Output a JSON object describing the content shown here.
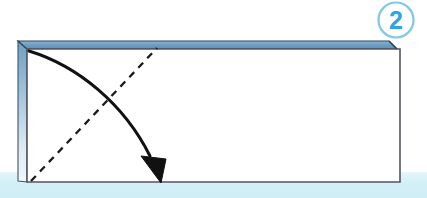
{
  "illustration": {
    "title": "Paper folding step diagram",
    "step_badge": {
      "label": "2",
      "shape": "circle-outline",
      "circle_color": "#7ec8ea",
      "text_color": "#2ba6e0",
      "center_x": 396,
      "center_y": 20,
      "radius": 18
    },
    "surface_band": {
      "name": "table-surface",
      "color": "#d6f0f7",
      "top_y": 172,
      "height": 26
    },
    "paper": {
      "front_sheet": {
        "name": "paper-front-sheet",
        "fill": "#ffffff",
        "stroke": "#4a4a52",
        "left": 27,
        "top": 49,
        "right": 400,
        "bottom": 182
      },
      "back_sheet_top_edge": {
        "name": "paper-back-top-edge",
        "fill": "#6f9fc4",
        "stroke": "#2f4558",
        "left": 18,
        "top": 41,
        "right": 397,
        "bottom": 49
      },
      "back_sheet_left_edge": {
        "name": "paper-back-left-edge",
        "fill_top": "#6f9fc4",
        "fill_bottom": "#eef4f8",
        "stroke": "#2f4558",
        "x": 18,
        "top": 41,
        "bottom": 181
      }
    },
    "fold_line": {
      "name": "dashed-fold-line",
      "style": "dashed",
      "color": "#1a1a1a",
      "width": 2.2,
      "dash": "7 6",
      "from_x": 31,
      "from_y": 181,
      "to_x": 157,
      "to_y": 48
    },
    "motion_arrow": {
      "name": "fold-motion-arrow",
      "color": "#111111",
      "width": 2.8,
      "start_x": 29,
      "start_y": 51,
      "control_x": 96,
      "control_y": 86,
      "end_x": 153,
      "end_y": 160,
      "arrowhead_tip_x": 160,
      "arrowhead_tip_y": 183
    }
  }
}
